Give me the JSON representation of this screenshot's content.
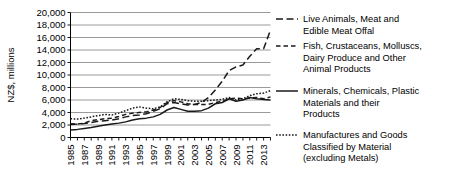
{
  "chart_data": {
    "type": "line",
    "title": "",
    "xlabel": "",
    "ylabel": "NZ$, millions",
    "ylim": [
      0,
      20000
    ],
    "ytick_values": [
      0,
      2000,
      4000,
      6000,
      8000,
      10000,
      12000,
      14000,
      16000,
      18000,
      20000
    ],
    "ytick_labels": [
      "0",
      "2,000",
      "4,000",
      "6,000",
      "8,000",
      "10,000",
      "12,000",
      "14,000",
      "16,000",
      "18,000",
      "20,000"
    ],
    "grid": true,
    "legend_position": "right",
    "x": [
      1985,
      1986,
      1987,
      1988,
      1989,
      1990,
      1991,
      1992,
      1993,
      1994,
      1995,
      1996,
      1997,
      1998,
      1999,
      2000,
      2001,
      2002,
      2003,
      2004,
      2005,
      2006,
      2007,
      2008,
      2009,
      2010,
      2011,
      2012,
      2013,
      2014
    ],
    "xtick_labels": [
      "1985",
      "1987",
      "1989",
      "1991",
      "1993",
      "1995",
      "1997",
      "1999",
      "2001",
      "2003",
      "2005",
      "2007",
      "2009",
      "2011",
      "2013"
    ],
    "xtick_values": [
      1985,
      1987,
      1989,
      1991,
      1993,
      1995,
      1997,
      1999,
      2001,
      2003,
      2005,
      2007,
      2009,
      2011,
      2013
    ],
    "series": [
      {
        "name": "Live Animals, Meat and Edible Meat Offal",
        "dash": "long-dash",
        "values": [
          2100,
          2150,
          2250,
          2400,
          2600,
          2700,
          2800,
          3000,
          3300,
          3500,
          3600,
          3800,
          4200,
          4600,
          5400,
          5600,
          5400,
          5200,
          5300,
          5600,
          6400,
          7600,
          9000,
          10700,
          11300,
          11600,
          13000,
          14200,
          14200,
          17200
        ]
      },
      {
        "name": "Fish, Crustaceans, Molluscs, Dairy Produce and Other Animal Products",
        "dash": "medium-dash",
        "values": [
          2200,
          2150,
          2300,
          2700,
          2850,
          3000,
          3100,
          3350,
          3700,
          3900,
          4000,
          4100,
          4400,
          4800,
          5600,
          5900,
          5700,
          5400,
          5300,
          5300,
          5300,
          5600,
          5800,
          6200,
          6300,
          6200,
          6300,
          6400,
          6200,
          6500
        ]
      },
      {
        "name": "Minerals, Chemicals, Plastic Materials and their Products",
        "dash": "solid",
        "values": [
          1200,
          1300,
          1450,
          1600,
          1800,
          2000,
          2150,
          2300,
          2500,
          2800,
          3000,
          3100,
          3300,
          3700,
          4400,
          4800,
          4500,
          4200,
          4200,
          4300,
          4700,
          5400,
          5600,
          6200,
          5800,
          6000,
          6400,
          6200,
          6100,
          6000
        ]
      },
      {
        "name": "Manufactures and Goods Classified by Material (excluding Metals)",
        "dash": "dotted",
        "values": [
          3000,
          2950,
          3100,
          3300,
          3500,
          3700,
          3600,
          3900,
          4300,
          4700,
          4900,
          4700,
          4600,
          4900,
          5700,
          6200,
          6100,
          5900,
          5800,
          5800,
          5900,
          6000,
          6100,
          6400,
          6000,
          6200,
          6700,
          7000,
          7100,
          7500
        ]
      }
    ]
  },
  "legend": {
    "entries": [
      {
        "label_line1": "Live Animals, Meat and",
        "label_line2": "Edible Meat Offal",
        "label_line3": ""
      },
      {
        "label_line1": "Fish, Crustaceans, Molluscs,",
        "label_line2": "Dairy Produce and Other",
        "label_line3": "Animal Products"
      },
      {
        "label_line1": "Minerals, Chemicals, Plastic",
        "label_line2": "Materials and their",
        "label_line3": "Products"
      },
      {
        "label_line1": "Manufactures and Goods",
        "label_line2": "Classified by Material",
        "label_line3": "(excluding Metals)"
      }
    ]
  }
}
